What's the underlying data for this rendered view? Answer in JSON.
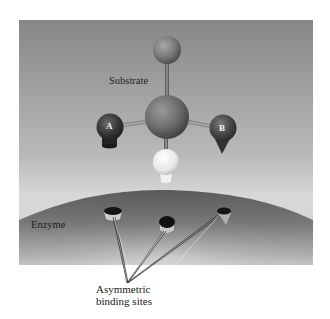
{
  "figure": {
    "labels": {
      "substrate": "Substrate",
      "enzyme": "Enzyme",
      "binding_sites_line1": "Asymmetric",
      "binding_sites_line2": "binding sites"
    },
    "atoms": {
      "a": "A",
      "b": "B"
    },
    "colors": {
      "background": "#ffffff",
      "panel_top": "#8c8c8c",
      "panel_bottom": "#d6d6d6",
      "enzyme_dark": "#5f5f5f",
      "enzyme_light": "#c9c9c9",
      "central_atom": "#6e6e6e",
      "top_atom": "#7a7a7a",
      "atom_a": "#3a3a3a",
      "atom_b": "#4a4a4a",
      "bottom_atom": "#eeeeee"
    }
  }
}
